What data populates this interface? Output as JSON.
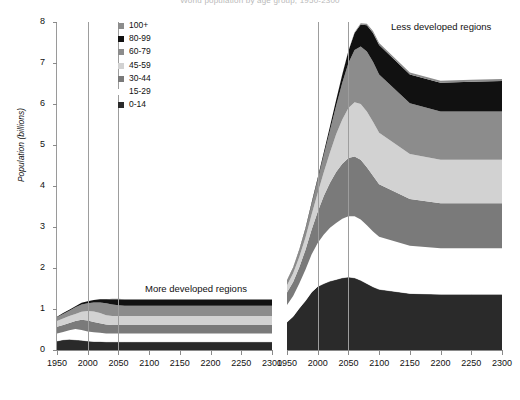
{
  "chart_data": {
    "type": "area",
    "title": "World population by age group, 1950-2300",
    "ylabel": "Population (billions)",
    "xlabel": "",
    "ylim": [
      0,
      8
    ],
    "yticks": [
      0,
      1,
      2,
      3,
      4,
      5,
      6,
      7,
      8
    ],
    "xlim": [
      1950,
      2300
    ],
    "xticks": [
      1950,
      2000,
      2050,
      2100,
      2150,
      2200,
      2250,
      2300
    ],
    "xtick_labels": [
      "1950",
      "2000",
      "2050",
      "2100",
      "2150",
      "2200",
      "2250",
      "2300"
    ],
    "gridlines_x": [
      2000,
      2050
    ],
    "grid": true,
    "legend_position": "top-left",
    "stack_order_top_to_bottom": [
      "100+",
      "80-99",
      "60-79",
      "45-59",
      "30-44",
      "15-29",
      "0-14"
    ],
    "legend": [
      {
        "label": "100+",
        "color": "#8c8c8c"
      },
      {
        "label": "80-99",
        "color": "#111111"
      },
      {
        "label": "60-79",
        "color": "#8c8c8c"
      },
      {
        "label": "45-59",
        "color": "#d2d2d2"
      },
      {
        "label": "30-44",
        "color": "#7a7a7a"
      },
      {
        "label": "15-29",
        "color": "#ffffff"
      },
      {
        "label": "0-14",
        "color": "#2a2a2a"
      }
    ],
    "panels": [
      {
        "name": "more-developed-regions",
        "label": "More developed regions",
        "x": [
          1950,
          1960,
          1970,
          1980,
          1990,
          2000,
          2010,
          2020,
          2030,
          2040,
          2050,
          2060,
          2070,
          2080,
          2090,
          2100,
          2150,
          2200,
          2250,
          2300
        ],
        "series": [
          {
            "name": "0-14",
            "values": [
              0.22,
              0.25,
              0.26,
              0.25,
              0.24,
              0.22,
              0.21,
              0.21,
              0.2,
              0.2,
              0.2,
              0.2,
              0.2,
              0.2,
              0.2,
              0.2,
              0.2,
              0.2,
              0.2,
              0.2
            ]
          },
          {
            "name": "15-29",
            "values": [
              0.18,
              0.19,
              0.22,
              0.26,
              0.25,
              0.23,
              0.22,
              0.21,
              0.2,
              0.2,
              0.2,
              0.2,
              0.2,
              0.2,
              0.2,
              0.2,
              0.2,
              0.2,
              0.2,
              0.2
            ]
          },
          {
            "name": "30-44",
            "values": [
              0.17,
              0.17,
              0.18,
              0.2,
              0.25,
              0.27,
              0.25,
              0.23,
              0.22,
              0.21,
              0.21,
              0.21,
              0.21,
              0.21,
              0.21,
              0.21,
              0.21,
              0.21,
              0.21,
              0.21
            ]
          },
          {
            "name": "45-59",
            "values": [
              0.14,
              0.16,
              0.17,
              0.17,
              0.19,
              0.23,
              0.26,
              0.25,
              0.23,
              0.22,
              0.22,
              0.22,
              0.22,
              0.22,
              0.22,
              0.22,
              0.22,
              0.22,
              0.22,
              0.22
            ]
          },
          {
            "name": "60-79",
            "values": [
              0.09,
              0.11,
              0.13,
              0.16,
              0.18,
              0.19,
              0.22,
              0.26,
              0.29,
              0.28,
              0.26,
              0.25,
              0.25,
              0.25,
              0.25,
              0.25,
              0.25,
              0.25,
              0.25,
              0.25
            ]
          },
          {
            "name": "80-99",
            "values": [
              0.01,
              0.02,
              0.02,
              0.03,
              0.04,
              0.05,
              0.06,
              0.08,
              0.1,
              0.13,
              0.15,
              0.15,
              0.15,
              0.15,
              0.15,
              0.15,
              0.15,
              0.15,
              0.15,
              0.15
            ]
          },
          {
            "name": "100+",
            "values": [
              0.0,
              0.0,
              0.0,
              0.0,
              0.0,
              0.0,
              0.0,
              0.0,
              0.0,
              0.01,
              0.01,
              0.01,
              0.01,
              0.01,
              0.01,
              0.01,
              0.01,
              0.01,
              0.01,
              0.01
            ]
          }
        ],
        "total": [
          0.81,
          0.9,
          0.98,
          1.07,
          1.15,
          1.19,
          1.22,
          1.24,
          1.24,
          1.25,
          1.25,
          1.24,
          1.24,
          1.24,
          1.24,
          1.24,
          1.24,
          1.24,
          1.24,
          1.24
        ],
        "total_start": 0.81,
        "total_peak": 1.25,
        "total_peak_year": 2040,
        "total_end": 1.24
      },
      {
        "name": "less-developed-regions",
        "label": "Less developed regions",
        "x": [
          1950,
          1960,
          1970,
          1980,
          1990,
          2000,
          2010,
          2020,
          2030,
          2040,
          2050,
          2060,
          2070,
          2080,
          2090,
          2100,
          2150,
          2200,
          2250,
          2300
        ],
        "series": [
          {
            "name": "0-14",
            "values": [
              0.68,
              0.82,
              1.02,
              1.2,
              1.41,
              1.55,
              1.62,
              1.68,
              1.72,
              1.76,
              1.78,
              1.76,
              1.7,
              1.62,
              1.54,
              1.48,
              1.38,
              1.36,
              1.36,
              1.36
            ]
          },
          {
            "name": "15-29",
            "values": [
              0.42,
              0.5,
              0.6,
              0.76,
              0.92,
              1.06,
              1.2,
              1.3,
              1.38,
              1.44,
              1.48,
              1.5,
              1.48,
              1.42,
              1.35,
              1.28,
              1.16,
              1.12,
              1.12,
              1.12
            ]
          },
          {
            "name": "30-44",
            "values": [
              0.3,
              0.34,
              0.4,
              0.48,
              0.6,
              0.76,
              0.94,
              1.1,
              1.24,
              1.34,
              1.42,
              1.46,
              1.46,
              1.42,
              1.36,
              1.28,
              1.14,
              1.1,
              1.1,
              1.1
            ]
          },
          {
            "name": "45-59",
            "values": [
              0.18,
              0.21,
              0.25,
              0.3,
              0.37,
              0.46,
              0.58,
              0.74,
              0.92,
              1.08,
              1.22,
              1.32,
              1.36,
              1.36,
              1.32,
              1.26,
              1.1,
              1.06,
              1.06,
              1.06
            ]
          },
          {
            "name": "60-79",
            "values": [
              0.11,
              0.13,
              0.16,
              0.2,
              0.25,
              0.32,
              0.42,
              0.54,
              0.7,
              0.9,
              1.1,
              1.28,
              1.4,
              1.46,
              1.46,
              1.42,
              1.24,
              1.18,
              1.18,
              1.18
            ]
          },
          {
            "name": "80-99",
            "values": [
              0.01,
              0.01,
              0.02,
              0.03,
              0.04,
              0.05,
              0.07,
              0.1,
              0.14,
              0.2,
              0.29,
              0.41,
              0.54,
              0.64,
              0.7,
              0.72,
              0.7,
              0.7,
              0.72,
              0.74
            ]
          },
          {
            "name": "100+",
            "values": [
              0.0,
              0.0,
              0.0,
              0.0,
              0.0,
              0.0,
              0.0,
              0.0,
              0.0,
              0.01,
              0.01,
              0.02,
              0.03,
              0.04,
              0.05,
              0.05,
              0.05,
              0.05,
              0.05,
              0.05
            ]
          }
        ],
        "total": [
          1.7,
          2.01,
          2.45,
          2.97,
          3.59,
          4.2,
          4.83,
          5.46,
          6.1,
          6.73,
          7.3,
          7.75,
          7.97,
          7.96,
          7.78,
          7.49,
          6.77,
          6.57,
          6.59,
          6.61
        ],
        "total_start": 1.7,
        "total_peak": 7.97,
        "total_peak_year": 2070,
        "total_end": 6.61
      }
    ]
  }
}
